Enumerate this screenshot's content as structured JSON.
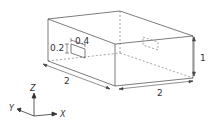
{
  "diagram": {
    "type": "isometric-box",
    "colors": {
      "line": "#444444",
      "hidden": "#666666",
      "text": "#333333"
    },
    "dimensions": {
      "length_x": "2",
      "width_y": "2",
      "height_z": "1",
      "opening_width": "0.4",
      "opening_height": "0.2"
    },
    "axes": {
      "x": "X",
      "y": "Y",
      "z": "Z"
    }
  }
}
